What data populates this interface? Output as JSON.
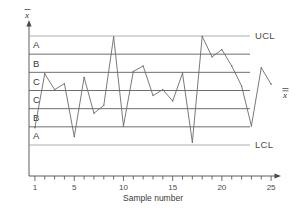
{
  "chart_data": {
    "type": "line",
    "title": "",
    "subtitle": "",
    "xlabel": "Sample number",
    "ylabel": "x-bar",
    "ylabel_symbol": "x̄",
    "grid": true,
    "legend_position": "none",
    "x": [
      1,
      2,
      3,
      4,
      5,
      6,
      7,
      8,
      9,
      10,
      11,
      12,
      13,
      14,
      15,
      16,
      17,
      18,
      19,
      20,
      21,
      22,
      23,
      24,
      25
    ],
    "xticks": [
      1,
      5,
      10,
      15,
      20,
      25
    ],
    "xtick_labels": [
      "1",
      "5",
      "10",
      "15",
      "20",
      "25"
    ],
    "xlim": [
      0.4,
      25.6
    ],
    "values": [
      -2.05,
      0.92,
      0.05,
      0.38,
      -2.55,
      0.72,
      -1.25,
      -0.82,
      2.95,
      -1.95,
      1.05,
      1.35,
      -0.28,
      0.05,
      -0.58,
      0.95,
      -2.85,
      2.98,
      1.85,
      2.25,
      1.35,
      0.25,
      -1.95,
      1.25,
      0.35
    ],
    "ylim": [
      -3.0,
      3.0
    ],
    "control_lines": [
      {
        "name": "UCL",
        "label": "UCL",
        "value": 3.0
      },
      {
        "name": "zone-A-upper-boundary",
        "label": "",
        "value": 2.0
      },
      {
        "name": "zone-B-upper-boundary",
        "label": "",
        "value": 1.0
      },
      {
        "name": "centerline",
        "label": "x-double-bar",
        "value": 0.0
      },
      {
        "name": "zone-B-lower-boundary",
        "label": "",
        "value": -1.0
      },
      {
        "name": "zone-A-lower-boundary",
        "label": "",
        "value": -2.0
      },
      {
        "name": "LCL",
        "label": "LCL",
        "value": -3.0
      }
    ],
    "zones": [
      {
        "label": "A",
        "upper": 3.0,
        "lower": 2.0,
        "side": "upper"
      },
      {
        "label": "B",
        "upper": 2.0,
        "lower": 1.0,
        "side": "upper"
      },
      {
        "label": "C",
        "upper": 1.0,
        "lower": 0.0,
        "side": "upper"
      },
      {
        "label": "C",
        "upper": 0.0,
        "lower": -1.0,
        "side": "lower"
      },
      {
        "label": "B",
        "upper": -1.0,
        "lower": -2.0,
        "side": "lower"
      },
      {
        "label": "A",
        "upper": -2.0,
        "lower": -3.0,
        "side": "lower"
      }
    ],
    "series_color": "#6b6b6b",
    "line_color": "#555555",
    "axis_color": "#4a4a4a"
  },
  "labels": {
    "ucl": "UCL",
    "lcl": "LCL",
    "zone_a_upper": "A",
    "zone_b_upper": "B",
    "zone_c_upper": "C",
    "zone_c_lower": "C",
    "zone_b_lower": "B",
    "zone_a_lower": "A",
    "x_axis_title": "Sample number",
    "y_axis_symbol": "x",
    "centerline_symbol": "x",
    "tick_1": "1",
    "tick_5": "5",
    "tick_10": "10",
    "tick_15": "15",
    "tick_20": "20",
    "tick_25": "25"
  }
}
